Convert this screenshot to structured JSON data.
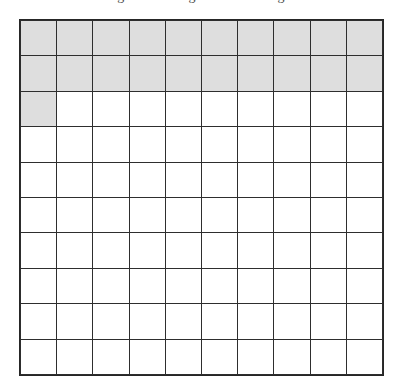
{
  "caption": {
    "text": "Figure: shading a hundredths grid"
  },
  "grid": {
    "rows": 10,
    "columns": 10,
    "total_cells": 100,
    "shaded_count": 21,
    "shaded_fraction": "21/100",
    "shaded_decimal": "0.21",
    "shaded_percent": "21%",
    "shaded_color": "#dedede",
    "unshaded_color": "#ffffff",
    "line_color": "#2e2e2e",
    "cells": [
      [
        1,
        1,
        1,
        1,
        1,
        1,
        1,
        1,
        1,
        1
      ],
      [
        1,
        1,
        1,
        1,
        1,
        1,
        1,
        1,
        1,
        1
      ],
      [
        1,
        0,
        0,
        0,
        0,
        0,
        0,
        0,
        0,
        0
      ],
      [
        0,
        0,
        0,
        0,
        0,
        0,
        0,
        0,
        0,
        0
      ],
      [
        0,
        0,
        0,
        0,
        0,
        0,
        0,
        0,
        0,
        0
      ],
      [
        0,
        0,
        0,
        0,
        0,
        0,
        0,
        0,
        0,
        0
      ],
      [
        0,
        0,
        0,
        0,
        0,
        0,
        0,
        0,
        0,
        0
      ],
      [
        0,
        0,
        0,
        0,
        0,
        0,
        0,
        0,
        0,
        0
      ],
      [
        0,
        0,
        0,
        0,
        0,
        0,
        0,
        0,
        0,
        0
      ],
      [
        0,
        0,
        0,
        0,
        0,
        0,
        0,
        0,
        0,
        0
      ]
    ]
  },
  "chart_data": {
    "type": "heatmap",
    "title": "Figure: shading a hundredths grid",
    "xlabel": "",
    "ylabel": "",
    "grid": true,
    "legend": "none",
    "rows": 10,
    "columns": 10,
    "categories": [
      "c1",
      "c2",
      "c3",
      "c4",
      "c5",
      "c6",
      "c7",
      "c8",
      "c9",
      "c10"
    ],
    "row_labels": [
      "r1",
      "r2",
      "r3",
      "r4",
      "r5",
      "r6",
      "r7",
      "r8",
      "r9",
      "r10"
    ],
    "values": [
      [
        1,
        1,
        1,
        1,
        1,
        1,
        1,
        1,
        1,
        1
      ],
      [
        1,
        1,
        1,
        1,
        1,
        1,
        1,
        1,
        1,
        1
      ],
      [
        1,
        0,
        0,
        0,
        0,
        0,
        0,
        0,
        0,
        0
      ],
      [
        0,
        0,
        0,
        0,
        0,
        0,
        0,
        0,
        0,
        0
      ],
      [
        0,
        0,
        0,
        0,
        0,
        0,
        0,
        0,
        0,
        0
      ],
      [
        0,
        0,
        0,
        0,
        0,
        0,
        0,
        0,
        0,
        0
      ],
      [
        0,
        0,
        0,
        0,
        0,
        0,
        0,
        0,
        0,
        0
      ],
      [
        0,
        0,
        0,
        0,
        0,
        0,
        0,
        0,
        0,
        0
      ],
      [
        0,
        0,
        0,
        0,
        0,
        0,
        0,
        0,
        0,
        0
      ],
      [
        0,
        0,
        0,
        0,
        0,
        0,
        0,
        0,
        0,
        0
      ]
    ],
    "value_colors": {
      "0": "#ffffff",
      "1": "#dedede"
    },
    "row_shaded_counts": [
      10,
      10,
      1,
      0,
      0,
      0,
      0,
      0,
      0,
      0
    ],
    "shaded_total": 21,
    "annotations": [
      "21 of 100 squares shaded"
    ]
  }
}
